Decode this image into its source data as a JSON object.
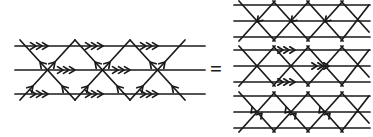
{
  "figure": {
    "type": "lattice-identity-diagram",
    "relation_symbol": "=",
    "stroke_color": "#1a1a1a",
    "background_color": "#ffffff",
    "line_width": 1.6,
    "chevron_count_per_segment": 3,
    "lhs": {
      "label": "left-lattice",
      "rows": 3,
      "columns": 3,
      "horizontal_lines": 3,
      "horizontal_chevron_direction": "left",
      "diagonal_arrow_direction": "down",
      "vertex_count": 3
    },
    "rhs": {
      "label": "right-lattice-stack",
      "panels": [
        {
          "label": "top-panel",
          "horizontal_lines": 3,
          "arrow_style": "up-right-into-middle-vertices",
          "chevrons": "none",
          "arrow_count": 3
        },
        {
          "label": "middle-panel",
          "horizontal_lines": 3,
          "arrow_style": "left-chevrons-on-horizontals",
          "chevrons": "triple-left",
          "chevron_rows": 3
        },
        {
          "label": "bottom-panel",
          "horizontal_lines": 3,
          "arrow_style": "converging-into-middle-vertices",
          "chevrons": "none",
          "arrow_count": 3
        }
      ]
    }
  }
}
